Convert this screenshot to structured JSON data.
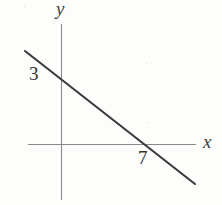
{
  "figure": {
    "background_color": "#fdfdfb",
    "line_color": "#3a3a3a",
    "axis_color": "#8a8a8a",
    "text_color": "#2f2f2f"
  },
  "labels": {
    "y_axis": "y",
    "x_axis": "x",
    "y_intercept": "3",
    "x_intercept": "7"
  },
  "chart_data": {
    "type": "line",
    "title": "",
    "xlabel": "x",
    "ylabel": "y",
    "grid": false,
    "legend": null,
    "xlim": [
      -2.4,
      9.6
    ],
    "ylim": [
      -2.4,
      6.9
    ],
    "axis_origin_px": [
      61,
      144
    ],
    "units_per_px": {
      "x": 12.3,
      "y": 23.0
    },
    "series": [
      {
        "name": "line",
        "equation": "y = -3x/7 + 3",
        "slope": -0.4286,
        "intercept": 3,
        "x": [
          -2.9,
          10.9
        ],
        "y": [
          4.24,
          -1.67
        ],
        "endpoints_px": [
          [
            25,
            51
          ],
          [
            195,
            184
          ]
        ]
      }
    ],
    "annotations": [
      {
        "text": "3",
        "value": 3,
        "axis": "y",
        "type": "y-intercept",
        "px": [
          30,
          66
        ]
      },
      {
        "text": "7",
        "value": 7,
        "axis": "x",
        "type": "x-intercept",
        "px": [
          139,
          150
        ]
      }
    ],
    "axes": {
      "x_axis_px": {
        "x1": 28,
        "y1": 144,
        "x2": 196,
        "y2": 144
      },
      "y_axis_px": {
        "x1": 61,
        "y1": 24,
        "x2": 61,
        "y2": 200
      }
    }
  }
}
